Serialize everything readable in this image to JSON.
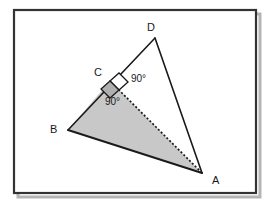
{
  "figure": {
    "title": "",
    "frame": {
      "x": 14,
      "y": 10,
      "width": 242,
      "height": 183,
      "border_color": "#333333",
      "shadow_color": "#b5b5b5",
      "fill_color": "#ffffff"
    },
    "colors": {
      "stroke": "#1a1a1a",
      "shaded_fill": "#c8c8c8",
      "right_angle_fill": "#ffffff",
      "right_angle_fill_shaded": "#b0b0b0",
      "background": "#ffffff"
    },
    "points": [
      {
        "id": "A",
        "label": "A",
        "x": 202,
        "y": 173,
        "label_x": 212,
        "label_y": 184
      },
      {
        "id": "B",
        "label": "B",
        "x": 68,
        "y": 130,
        "label_x": 50,
        "label_y": 133
      },
      {
        "id": "C",
        "label": "C",
        "x": 110,
        "y": 81,
        "label_x": 94,
        "label_y": 76
      },
      {
        "id": "D",
        "label": "D",
        "x": 155,
        "y": 38,
        "label_x": 147,
        "label_y": 31
      }
    ],
    "shaded_region": {
      "name": "triangle-ABC",
      "vertices": [
        "B",
        "C",
        "A"
      ],
      "points": "68,130 110,81 202,173"
    },
    "solid_edges": [
      {
        "name": "edge-B-D",
        "from": "B",
        "to": "D",
        "x1": 68,
        "y1": 130,
        "x2": 155,
        "y2": 38
      },
      {
        "name": "edge-D-A",
        "from": "D",
        "to": "A",
        "x1": 155,
        "y1": 38,
        "x2": 202,
        "y2": 173
      },
      {
        "name": "edge-B-A",
        "from": "B",
        "to": "A",
        "x1": 68,
        "y1": 130,
        "x2": 202,
        "y2": 173
      }
    ],
    "dotted_edges": [
      {
        "name": "edge-C-A",
        "from": "C",
        "to": "A",
        "x1": 110,
        "y1": 81,
        "x2": 202,
        "y2": 173,
        "dash": "2,2"
      }
    ],
    "right_angles": [
      {
        "name": "right-angle-DCA",
        "vertex": "C",
        "label": "90°",
        "label_x": 131,
        "label_y": 82,
        "filled": false,
        "marker_points": "110,81 119,73 128,82 119,90"
      },
      {
        "name": "right-angle-BCA",
        "vertex": "C",
        "label": "90°",
        "label_x": 105,
        "label_y": 105,
        "filled": true,
        "marker_points": "110,81 101,89 110,98 119,90"
      }
    ]
  }
}
